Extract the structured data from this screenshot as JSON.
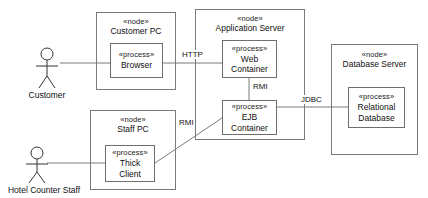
{
  "diagram": {
    "type": "uml-deployment-diagram",
    "stereotype_node": "«node»",
    "stereotype_process": "«process»",
    "background_color": "#ffffff",
    "line_color": "#7a7a7a",
    "text_color": "#111111"
  },
  "actors": [
    {
      "id": "customer",
      "label": "Customer"
    },
    {
      "id": "hotel-counter-staff",
      "label": "Hotel Counter Staff"
    }
  ],
  "nodes": [
    {
      "id": "customer-pc",
      "stereotype": "«node»",
      "name": "Customer PC",
      "processes": [
        {
          "id": "browser",
          "stereotype": "«process»",
          "name": "Browser"
        }
      ]
    },
    {
      "id": "application-server",
      "stereotype": "«node»",
      "name": "Application Server",
      "processes": [
        {
          "id": "web-container",
          "stereotype": "«process»",
          "name_line1": "Web",
          "name_line2": "Container"
        },
        {
          "id": "ejb-container",
          "stereotype": "«process»",
          "name_line1": "EJB",
          "name_line2": "Container"
        }
      ]
    },
    {
      "id": "database-server",
      "stereotype": "«node»",
      "name": "Database Server",
      "processes": [
        {
          "id": "relational-database",
          "stereotype": "«process»",
          "name_line1": "Relational",
          "name_line2": "Database"
        }
      ]
    },
    {
      "id": "staff-pc",
      "stereotype": "«node»",
      "name": "Staff PC",
      "processes": [
        {
          "id": "thick-client",
          "stereotype": "«process»",
          "name_line1": "Thick",
          "name_line2": "Client"
        }
      ]
    }
  ],
  "connections": [
    {
      "id": "customer-to-browser",
      "label": ""
    },
    {
      "id": "browser-to-web-container",
      "label": "HTTP"
    },
    {
      "id": "web-to-ejb-container",
      "label": "RMI"
    },
    {
      "id": "ejb-to-database",
      "label": "JDBC"
    },
    {
      "id": "thick-client-to-ejb",
      "label": "RMI"
    },
    {
      "id": "staff-to-thick-client",
      "label": ""
    }
  ]
}
